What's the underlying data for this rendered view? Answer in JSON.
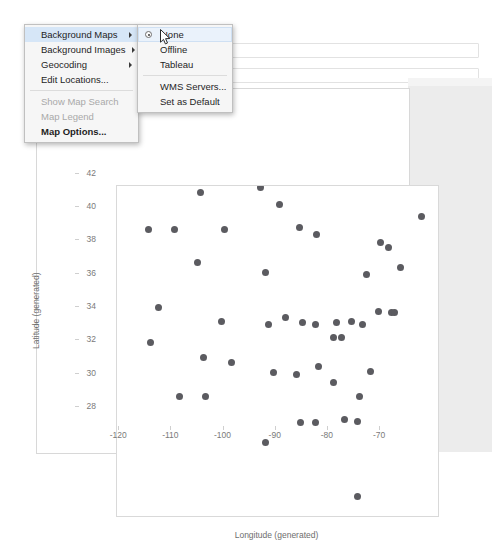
{
  "context_menu": {
    "items": [
      {
        "label": "Background Maps",
        "submenu": true,
        "disabled": false,
        "selected": true,
        "bold": false
      },
      {
        "label": "Background Images",
        "submenu": true,
        "disabled": false,
        "selected": false,
        "bold": false
      },
      {
        "label": "Geocoding",
        "submenu": true,
        "disabled": false,
        "selected": false,
        "bold": false
      },
      {
        "label": "Edit Locations...",
        "submenu": false,
        "disabled": false,
        "selected": false,
        "bold": false
      },
      {
        "label": "Show Map Search",
        "submenu": false,
        "disabled": true,
        "selected": false,
        "bold": false
      },
      {
        "label": "Map Legend",
        "submenu": false,
        "disabled": true,
        "selected": false,
        "bold": false
      },
      {
        "label": "Map Options...",
        "submenu": false,
        "disabled": false,
        "selected": false,
        "bold": true
      }
    ],
    "separators_after": [
      3,
      6
    ]
  },
  "submenu": {
    "items": [
      {
        "label": "None",
        "radio": true,
        "highlighted": true
      },
      {
        "label": "Offline",
        "radio": false,
        "highlighted": false
      },
      {
        "label": "Tableau",
        "radio": false,
        "highlighted": false
      },
      {
        "label": "WMS Servers...",
        "radio": false,
        "highlighted": false
      },
      {
        "label": "Set as Default",
        "radio": false,
        "highlighted": false
      }
    ],
    "separator_after": 2
  },
  "icons": {
    "submenu_arrow": "chevron-right-icon",
    "radio_selected": "radio-selected-icon",
    "cursor": "mouse-pointer-icon"
  },
  "colors": {
    "mark": "#5b5b60",
    "menu_bg": "#f6f6f6",
    "menu_border": "#c0c0c0",
    "highlight": "#d6e6f7",
    "axis_text": "#7a7a7a",
    "panel_grey": "#ececec"
  },
  "chart_data": {
    "type": "scatter",
    "title": "",
    "xlabel": "Longitude (generated)",
    "ylabel": "Latitude (generated)",
    "xlim": [
      -127.5,
      -66.0
    ],
    "ylim": [
      26.8,
      46.6
    ],
    "xticks": [
      -120,
      -110,
      -100,
      -90,
      -80,
      -70
    ],
    "yticks": [
      28,
      30,
      32,
      34,
      36,
      38,
      40,
      42,
      44,
      46
    ],
    "grid": false,
    "legend": "none",
    "series": [
      {
        "name": "State",
        "points": [
          [
            -111.5,
            46.2
          ],
          [
            -100.0,
            46.5
          ],
          [
            -96.3,
            45.5
          ],
          [
            -121.5,
            44.0
          ],
          [
            -116.5,
            44.0
          ],
          [
            -107.0,
            44.0
          ],
          [
            -92.5,
            44.1
          ],
          [
            -89.3,
            43.7
          ],
          [
            -69.2,
            44.8
          ],
          [
            -77.0,
            43.2
          ],
          [
            -75.5,
            42.9
          ],
          [
            -112.0,
            42.0
          ],
          [
            -99.0,
            41.4
          ],
          [
            -79.8,
            41.3
          ],
          [
            -73.1,
            41.7
          ],
          [
            -119.5,
            39.3
          ],
          [
            -95.3,
            38.7
          ],
          [
            -107.5,
            38.5
          ],
          [
            -77.5,
            39.1
          ],
          [
            -75.0,
            39.0
          ],
          [
            -74.3,
            39.0
          ],
          [
            -92.0,
            38.4
          ],
          [
            -89.5,
            38.3
          ],
          [
            -85.5,
            38.4
          ],
          [
            -121.0,
            37.2
          ],
          [
            -98.5,
            38.3
          ],
          [
            -86.0,
            37.5
          ],
          [
            -80.5,
            38.3
          ],
          [
            -84.5,
            37.5
          ],
          [
            -82.5,
            38.5
          ],
          [
            -111.0,
            36.3
          ],
          [
            -105.5,
            36.0
          ],
          [
            -97.5,
            35.4
          ],
          [
            -93.2,
            35.3
          ],
          [
            -89.0,
            35.8
          ],
          [
            -79.0,
            35.5
          ],
          [
            -86.0,
            34.8
          ],
          [
            -81.0,
            34.0
          ],
          [
            -115.5,
            34.0
          ],
          [
            -110.5,
            34.0
          ],
          [
            -92.3,
            32.4
          ],
          [
            -89.5,
            32.4
          ],
          [
            -99.0,
            31.2
          ],
          [
            -84.0,
            32.6
          ],
          [
            -81.5,
            32.5
          ],
          [
            -81.5,
            28.0
          ]
        ]
      }
    ]
  },
  "shelves": {
    "rows_placeholder": "",
    "columns_placeholder": ""
  }
}
